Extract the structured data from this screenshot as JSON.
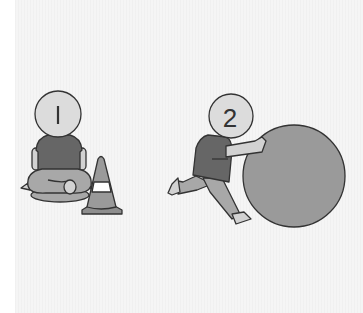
{
  "illustration": {
    "description": "Two cartoon figures: figure 1 sitting cross-legged next to a traffic cone, figure 2 pushing a large ball",
    "figures": [
      {
        "label": "1",
        "pose": "sitting cross-legged",
        "prop": "traffic cone"
      },
      {
        "label": "2",
        "pose": "pushing",
        "prop": "large ball"
      }
    ]
  },
  "colors": {
    "background": "#f5f5f5",
    "head": "#dcdcdc",
    "shirt": "#666666",
    "pants": "#a8a8a8",
    "skin": "#d2d2d2",
    "ball": "#9a9a9a",
    "cone": "#9a9a9a",
    "cone_band": "#ffffff",
    "outline": "#333333"
  }
}
